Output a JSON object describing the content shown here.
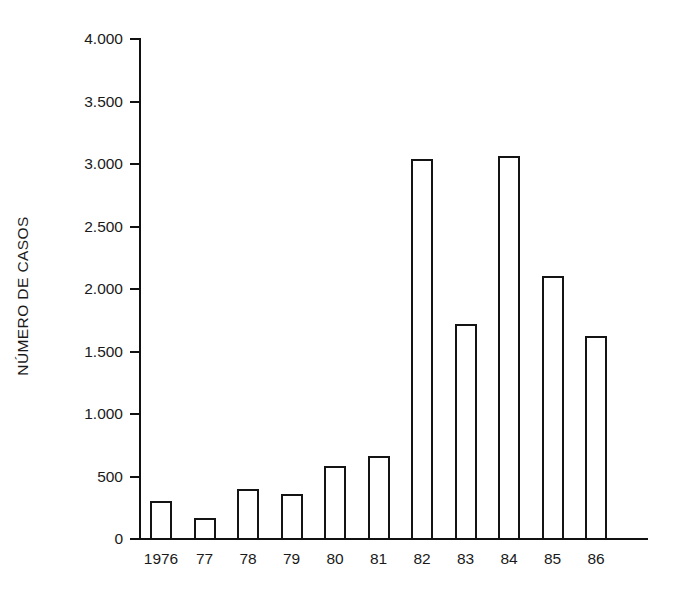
{
  "chart_data": {
    "type": "bar",
    "title": "",
    "subtitle": "",
    "xlabel": "",
    "ylabel": "NÚMERO DE CASOS",
    "categories": [
      "1976",
      "77",
      "78",
      "79",
      "80",
      "81",
      "82",
      "83",
      "84",
      "85",
      "86"
    ],
    "values": [
      300,
      160,
      390,
      350,
      580,
      660,
      3030,
      1710,
      3060,
      2100,
      1620
    ],
    "ylim": [
      0,
      4000
    ],
    "xlim_note": "categorical",
    "ytick_values": [
      0,
      500,
      1000,
      1500,
      2000,
      2500,
      3000,
      3500,
      4000
    ],
    "ytick_labels": [
      "0",
      "500",
      "1.000",
      "1.500",
      "2.000",
      "2.500",
      "3.000",
      "3.500",
      "4.000"
    ],
    "grid": false,
    "legend": null,
    "legend_position": "none",
    "bar_style": {
      "fill": "#ffffff",
      "edge": "#141414",
      "edge_width_px": 2
    },
    "annotations": []
  },
  "figure": {
    "background": "#ffffff",
    "text_color": "#1a1a1a"
  }
}
